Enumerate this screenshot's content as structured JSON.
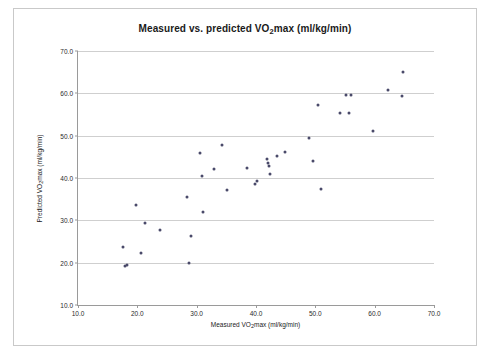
{
  "chart_data": {
    "type": "scatter",
    "title_parts": {
      "pre": "Measured vs. predicted VO",
      "sub": "2",
      "post": "max (ml/kg/min)"
    },
    "title": "Measured vs. predicted VO2max (ml/kg/min)",
    "xlabel_parts": {
      "pre": "Measured VO",
      "sub": "2",
      "post": "max (ml/kg/min)"
    },
    "xlabel": "Measured VO2max (ml/kg/min)",
    "ylabel_parts": {
      "pre": "Predicted VO",
      "sub": "2",
      "post": "max (ml/kg/min)"
    },
    "ylabel": "Predicted VO2max (ml/kg/min)",
    "xlim": [
      10.0,
      70.0
    ],
    "ylim": [
      10.0,
      70.0
    ],
    "xticks": [
      "10.0",
      "20.0",
      "30.0",
      "40.0",
      "50.0",
      "60.0",
      "70.0"
    ],
    "xtick_values": [
      10,
      20,
      30,
      40,
      50,
      60,
      70
    ],
    "yticks": [
      "10.0",
      "20.0",
      "30.0",
      "40.0",
      "50.0",
      "60.0",
      "70.0"
    ],
    "ytick_values": [
      10,
      20,
      30,
      40,
      50,
      60,
      70
    ],
    "grid": "horizontal",
    "legend": "none",
    "marker_color": "#4a4a6a",
    "points": [
      [
        17.6,
        23.6
      ],
      [
        17.9,
        19.2
      ],
      [
        18.2,
        19.4
      ],
      [
        19.8,
        33.6
      ],
      [
        20.6,
        22.3
      ],
      [
        21.3,
        29.3
      ],
      [
        23.9,
        27.8
      ],
      [
        28.3,
        35.5
      ],
      [
        28.7,
        20.0
      ],
      [
        29.1,
        26.2
      ],
      [
        30.6,
        45.9
      ],
      [
        30.9,
        40.4
      ],
      [
        31.1,
        31.9
      ],
      [
        33.0,
        42.2
      ],
      [
        34.2,
        47.9
      ],
      [
        35.1,
        37.2
      ],
      [
        38.4,
        42.4
      ],
      [
        39.9,
        38.6
      ],
      [
        40.1,
        39.2
      ],
      [
        41.8,
        44.5
      ],
      [
        42.0,
        43.5
      ],
      [
        42.2,
        42.9
      ],
      [
        42.4,
        41.0
      ],
      [
        43.5,
        45.2
      ],
      [
        44.9,
        46.1
      ],
      [
        48.9,
        49.5
      ],
      [
        49.6,
        43.9
      ],
      [
        50.5,
        57.3
      ],
      [
        50.9,
        37.5
      ],
      [
        54.2,
        55.4
      ],
      [
        55.2,
        59.6
      ],
      [
        55.6,
        55.3
      ],
      [
        56.0,
        59.6
      ],
      [
        59.8,
        51.2
      ],
      [
        62.2,
        60.9
      ],
      [
        64.6,
        59.3
      ],
      [
        64.8,
        65.0
      ]
    ]
  }
}
